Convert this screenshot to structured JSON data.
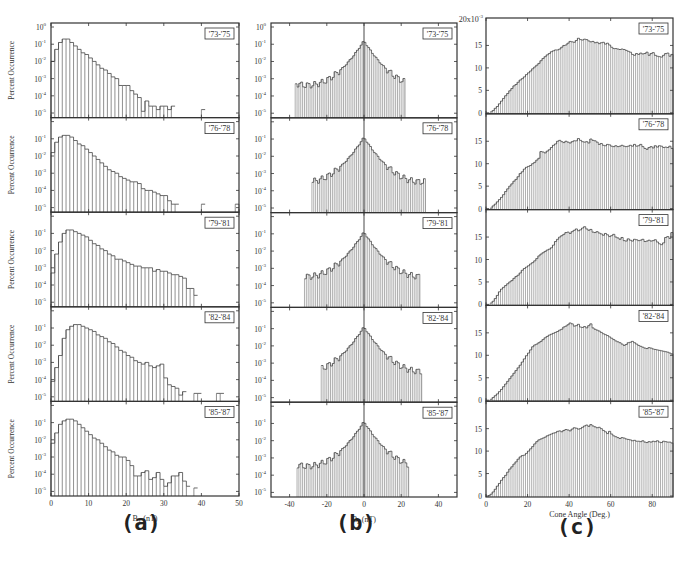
{
  "figure": {
    "panel_labels": [
      "(a)",
      "(b)",
      "(c)"
    ],
    "row_labels": [
      "'73-'75",
      "'76-'78",
      "'79-'81",
      "'82-'84",
      "'85-'87"
    ]
  },
  "chart_data": [
    {
      "id": "a",
      "type": "bar",
      "title": "",
      "xlabel": "B_T (nT)",
      "ylabel": "Percent Occurrence",
      "yscale": "log",
      "ylim": [
        1e-05,
        1
      ],
      "xlim": [
        0,
        50
      ],
      "xticks": [
        0,
        10,
        20,
        30,
        40,
        50
      ],
      "yticks": [
        "10^0",
        "10^-1",
        "10^-2",
        "10^-3",
        "10^-4",
        "10^-5"
      ],
      "bin_width": 1,
      "bin_start": 0,
      "series": [
        {
          "name": "'73-'75",
          "log_values": [
            -2,
            -1.3,
            -0.9,
            -0.7,
            -0.7,
            -0.9,
            -1.1,
            -1.3,
            -1.5,
            -1.6,
            -1.8,
            -2,
            -2.2,
            -2.4,
            -2.5,
            -2.7,
            -2.9,
            -3,
            -3.4,
            -3.4,
            -3.4,
            -3.7,
            -3.9,
            -4.1,
            -4.9,
            -4.3,
            -4.6,
            -4.6,
            -4.8,
            -4.6,
            -4.6,
            -4.8,
            -4.6,
            -5,
            -5,
            -5,
            -5,
            -5,
            -5,
            -5,
            -4.8,
            -5,
            -5,
            -5,
            -5,
            -5,
            -5,
            -5,
            -5,
            -5
          ]
        },
        {
          "name": "'76-'78",
          "log_values": [
            -1.8,
            -1.2,
            -0.9,
            -0.8,
            -0.8,
            -0.9,
            -1.1,
            -1.3,
            -1.4,
            -1.6,
            -1.8,
            -2,
            -2.2,
            -2.4,
            -2.6,
            -2.8,
            -2.9,
            -3,
            -3.2,
            -3.3,
            -3.4,
            -3.5,
            -3.5,
            -3.6,
            -3.9,
            -4,
            -4,
            -4.1,
            -4.2,
            -4.3,
            -4.3,
            -4.6,
            -4.8,
            -4.8,
            -5,
            -5,
            -5,
            -5,
            -5,
            -5,
            -4.8,
            -5,
            -5,
            -5,
            -5,
            -5,
            -5,
            -5,
            -5,
            -4.8
          ]
        },
        {
          "name": "'79-'81",
          "log_values": [
            -3.3,
            -2.2,
            -1.5,
            -1,
            -0.8,
            -0.8,
            -0.9,
            -1,
            -1.1,
            -1.2,
            -1.4,
            -1.6,
            -1.7,
            -1.9,
            -2,
            -2.2,
            -2.3,
            -2.5,
            -2.5,
            -2.6,
            -2.7,
            -2.8,
            -2.9,
            -2.9,
            -3,
            -3,
            -3,
            -3.2,
            -3.1,
            -3.2,
            -3.2,
            -3.3,
            -3.4,
            -3.4,
            -3.5,
            -3.6,
            -4.2,
            -4.2,
            -4.6,
            -5,
            -5,
            -5,
            -5,
            -5,
            -5,
            -5,
            -5,
            -5,
            -5,
            -5
          ]
        },
        {
          "name": "'82-'84",
          "log_values": [
            -4.1,
            -3.3,
            -2.6,
            -1.6,
            -1.1,
            -0.9,
            -0.8,
            -0.8,
            -0.9,
            -1,
            -1.1,
            -1.2,
            -1.4,
            -1.5,
            -1.6,
            -1.8,
            -1.9,
            -2.1,
            -2.3,
            -2.4,
            -2.6,
            -2.7,
            -2.9,
            -3,
            -3.1,
            -3,
            -3.2,
            -3.3,
            -3.2,
            -3.1,
            -3.9,
            -4.3,
            -4.4,
            -4.5,
            -4.9,
            -4.7,
            -5,
            -5,
            -4.8,
            -4.8,
            -5,
            -5,
            -5,
            -5,
            -4.8,
            -4.8,
            -5,
            -5,
            -5,
            -5
          ]
        },
        {
          "name": "'85-'87",
          "log_values": [
            -2.2,
            -1.6,
            -1.1,
            -0.9,
            -0.8,
            -0.8,
            -0.9,
            -1.1,
            -1.3,
            -1.5,
            -1.7,
            -1.9,
            -2,
            -2.2,
            -2.4,
            -2.6,
            -2.7,
            -2.9,
            -3,
            -3,
            -3.2,
            -3.5,
            -4.1,
            -4.1,
            -3.9,
            -3.8,
            -4.3,
            -4.2,
            -3.9,
            -4.3,
            -4.7,
            -4.5,
            -4.1,
            -4.1,
            -3.9,
            -4.4,
            -4.7,
            -5,
            -4.8,
            -5,
            -5,
            -5,
            -5,
            -5,
            -5,
            -5,
            -5,
            -5,
            -5,
            -5
          ]
        }
      ]
    },
    {
      "id": "b",
      "type": "bar",
      "title": "",
      "xlabel": "B_z (nT)",
      "ylabel": "",
      "yscale": "log",
      "ylim": [
        1e-05,
        1
      ],
      "xlim": [
        -50,
        50
      ],
      "xticks": [
        -40,
        -20,
        0,
        20,
        40
      ],
      "yticks": [
        "10^0",
        "10^-1",
        "10^-2",
        "10^-3",
        "10^-4",
        "10^-5"
      ],
      "bin_width": 1,
      "bin_start": -50,
      "series": [
        {
          "name": "'73-'75",
          "center_peak_log": -0.8,
          "left_extent": -37,
          "right_extent": 22
        },
        {
          "name": "'76-'78",
          "center_peak_log": -0.9,
          "left_extent": -28,
          "right_extent": 33
        },
        {
          "name": "'79-'81",
          "center_peak_log": -0.9,
          "left_extent": -32,
          "right_extent": 30
        },
        {
          "name": "'82-'84",
          "center_peak_log": -0.9,
          "left_extent": -23,
          "right_extent": 31
        },
        {
          "name": "'85-'87",
          "center_peak_log": -0.9,
          "left_extent": -36,
          "right_extent": 24
        }
      ]
    },
    {
      "id": "c",
      "type": "bar",
      "title": "",
      "xlabel": "Cone Angle (Deg.)",
      "ylabel": "",
      "yscale": "linear",
      "ylim": [
        0,
        0.02
      ],
      "y_multiplier_label": "20x10^-3",
      "xlim": [
        0,
        90
      ],
      "xticks": [
        0,
        20,
        40,
        60,
        80
      ],
      "yticks": [
        0,
        5,
        10,
        15
      ],
      "bin_width": 1,
      "bin_start": 0,
      "series": [
        {
          "name": "'73-'75",
          "values_x1000": [
            0,
            0,
            0.2,
            0.5,
            1,
            1.4,
            2,
            2.6,
            3.2,
            3.8,
            4.3,
            4.9,
            5.4,
            6,
            6.3,
            6.8,
            7.3,
            7.6,
            8,
            8.5,
            8.9,
            9.3,
            9.8,
            10.2,
            10.6,
            11,
            11.6,
            12.1,
            12.5,
            12.9,
            13.2,
            13.6,
            13.8,
            14,
            14,
            14.2,
            14.6,
            15,
            15.1,
            15.5,
            15.9,
            15.8,
            15.7,
            16.1,
            16.6,
            16.3,
            16.2,
            16.4,
            16.3,
            16,
            15.8,
            15.9,
            15.6,
            15.7,
            15.4,
            15.6,
            15.7,
            15.3,
            15.5,
            15.1,
            14.6,
            14.3,
            14.3,
            14.2,
            14.1,
            14.2,
            14.1,
            13.9,
            13.7,
            13.5,
            13,
            12.8,
            13.2,
            13,
            13.3,
            13.1,
            13.2,
            13.5,
            12.8,
            13.2,
            13.4,
            12.8,
            12.6,
            12.5,
            12.4,
            12.8,
            13.2,
            13.3,
            12.6,
            13
          ]
        },
        {
          "name": "'76-'78",
          "values_x1000": [
            0,
            0,
            0.1,
            0.6,
            1,
            1.5,
            2,
            2.5,
            3.1,
            3.8,
            4.4,
            5,
            5.5,
            6.1,
            6.5,
            7.1,
            7.8,
            8.2,
            8.8,
            9.2,
            9.4,
            9.6,
            10,
            10.3,
            10.8,
            11.2,
            12.7,
            12.6,
            12.4,
            12.8,
            13.1,
            13.6,
            14.1,
            14.4,
            15,
            15.2,
            14.9,
            14.7,
            15,
            14.8,
            14.6,
            14.9,
            15.1,
            15.1,
            15.6,
            15.2,
            14.9,
            14.8,
            14.9,
            14.6,
            15.5,
            15.2,
            15.1,
            14.8,
            14.3,
            14.5,
            14.1,
            14,
            14.3,
            14.2,
            13.9,
            13.8,
            14,
            13.8,
            13.9,
            14.1,
            13.9,
            13.8,
            13.9,
            14.1,
            13.9,
            14.3,
            13.9,
            14,
            14.3,
            13.8,
            13.4,
            13.2,
            13.6,
            13.8,
            13.5,
            14,
            13.7,
            14,
            13.9,
            13.6,
            13.7,
            13.6,
            13.9,
            13.4
          ]
        },
        {
          "name": "'79-'81",
          "values_x1000": [
            0,
            0,
            0.3,
            0.7,
            1.3,
            2,
            2.8,
            3.4,
            3.8,
            4.2,
            4.6,
            5,
            5.3,
            5.8,
            6.2,
            6.5,
            7,
            7.6,
            8,
            8.3,
            8.6,
            9,
            9.3,
            9.7,
            10.2,
            10.8,
            11.2,
            11.5,
            11.8,
            12.1,
            12.3,
            12.6,
            13.2,
            14,
            14.5,
            15,
            15.3,
            15.6,
            16,
            16.1,
            15.8,
            16.2,
            16.5,
            16.8,
            16.4,
            16.6,
            17,
            17.3,
            16.8,
            16.5,
            16.7,
            16.1,
            16,
            16.2,
            15.9,
            15.7,
            15.4,
            15.8,
            15.5,
            15.1,
            15.3,
            15.6,
            15,
            14.8,
            14.5,
            14.9,
            14.2,
            14.1,
            14.6,
            14.3,
            14.1,
            14.5,
            14.4,
            14.2,
            14.3,
            14.5,
            14,
            14.1,
            14.3,
            14.1,
            14.2,
            14.4,
            13.9,
            13.5,
            13.3,
            13.7,
            14.9,
            15.1,
            14.7,
            16
          ]
        },
        {
          "name": "'82-'84",
          "values_x1000": [
            0,
            0,
            0.2,
            0.6,
            1,
            1.4,
            1.9,
            2.4,
            3,
            3.6,
            4.2,
            4.8,
            5.4,
            6,
            6.6,
            7.2,
            7.8,
            8.5,
            9.2,
            9.9,
            10.5,
            11.2,
            11.9,
            12.3,
            12.5,
            12.8,
            13.1,
            13.5,
            13.9,
            14.2,
            14.5,
            14.7,
            14.9,
            15.1,
            15.3,
            15.6,
            15.8,
            16.3,
            16.5,
            16.8,
            17.2,
            17,
            16.5,
            16.6,
            16.9,
            16.3,
            16.2,
            16.4,
            16.1,
            16.6,
            17,
            16.1,
            15.8,
            15.6,
            15.4,
            15.1,
            14.8,
            14.6,
            14.4,
            14.1,
            13.8,
            13.5,
            13.2,
            13,
            12.8,
            12.5,
            12.2,
            12.4,
            12.8,
            12.9,
            13.1,
            12.8,
            12.5,
            12.2,
            12,
            11.8,
            11.6,
            11.5,
            11.7,
            11.6,
            11.4,
            11.3,
            11.2,
            11.1,
            11,
            10.9,
            10.8,
            10.7,
            10.5,
            10.3
          ]
        },
        {
          "name": "'85-'87",
          "values_x1000": [
            0,
            0.1,
            0.4,
            0.9,
            1.5,
            2.2,
            2.8,
            3.5,
            4.1,
            4.6,
            5.3,
            6,
            6.5,
            7.1,
            7.6,
            8.2,
            8.7,
            9,
            9.1,
            9.5,
            10,
            10.5,
            11,
            11.6,
            12.1,
            12.5,
            12.7,
            12.9,
            13.1,
            13.4,
            13.6,
            13.8,
            14,
            14.1,
            14.4,
            14.5,
            14.3,
            14.6,
            14.8,
            14.7,
            14.5,
            14.9,
            15.2,
            15.1,
            14.9,
            15,
            15.3,
            15.6,
            15.8,
            15.5,
            15.9,
            15.6,
            15.4,
            15.2,
            15.3,
            15,
            14.6,
            14.3,
            13.9,
            14.4,
            13.8,
            13.4,
            13.2,
            13,
            12.8,
            13,
            12.9,
            12.7,
            12.6,
            12.5,
            12.3,
            12.4,
            12.2,
            12.2,
            12.1,
            12.3,
            12,
            11.9,
            12.1,
            12,
            12.2,
            12.1,
            12.3,
            12,
            11.9,
            12.2,
            12.1,
            12,
            12,
            11.8
          ]
        }
      ]
    }
  ]
}
